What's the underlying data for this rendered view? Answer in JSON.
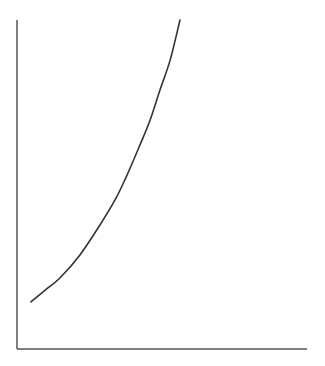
{
  "chart_data": {
    "type": "line",
    "title": "",
    "xlabel": "",
    "ylabel": "",
    "xlim": [
      0,
      1
    ],
    "ylim": [
      0,
      1
    ],
    "grid": false,
    "legend": null,
    "x_ticks": [],
    "y_ticks": [],
    "series": [
      {
        "name": "curve",
        "color": "#333333",
        "x": [
          0.048,
          0.097,
          0.148,
          0.217,
          0.286,
          0.338,
          0.372,
          0.424,
          0.459,
          0.493,
          0.528,
          0.562
        ],
        "values": [
          0.143,
          0.179,
          0.216,
          0.286,
          0.377,
          0.453,
          0.514,
          0.62,
          0.696,
          0.787,
          0.878,
          1.0
        ]
      }
    ]
  },
  "axes": {
    "color": "#555555",
    "origin_px": [
      17,
      349
    ],
    "x_end_px": 307,
    "y_top_px": 20
  }
}
